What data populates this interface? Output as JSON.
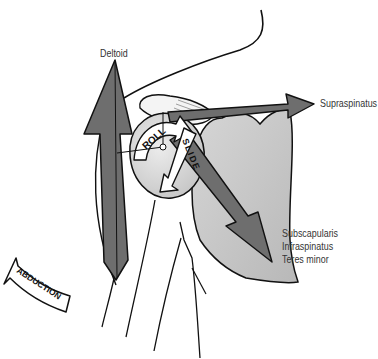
{
  "diagram": {
    "type": "anatomical shoulder diagram",
    "labels": {
      "deltoid": "Deltoid",
      "supraspinatus": "Supraspinatus",
      "rotator_lines": [
        "Subscapularis",
        "Infraspinatus",
        "Teres minor"
      ],
      "roll": "ROLL",
      "slide": "SLIDE",
      "abduction": "ABDUCTION"
    },
    "colors": {
      "muscle_arrow": "#6e6e6e",
      "bone_shade": "#c8c8c8",
      "humeral_head": "#d4d4d4",
      "outline": "#111111",
      "label_text": "#333333"
    }
  }
}
